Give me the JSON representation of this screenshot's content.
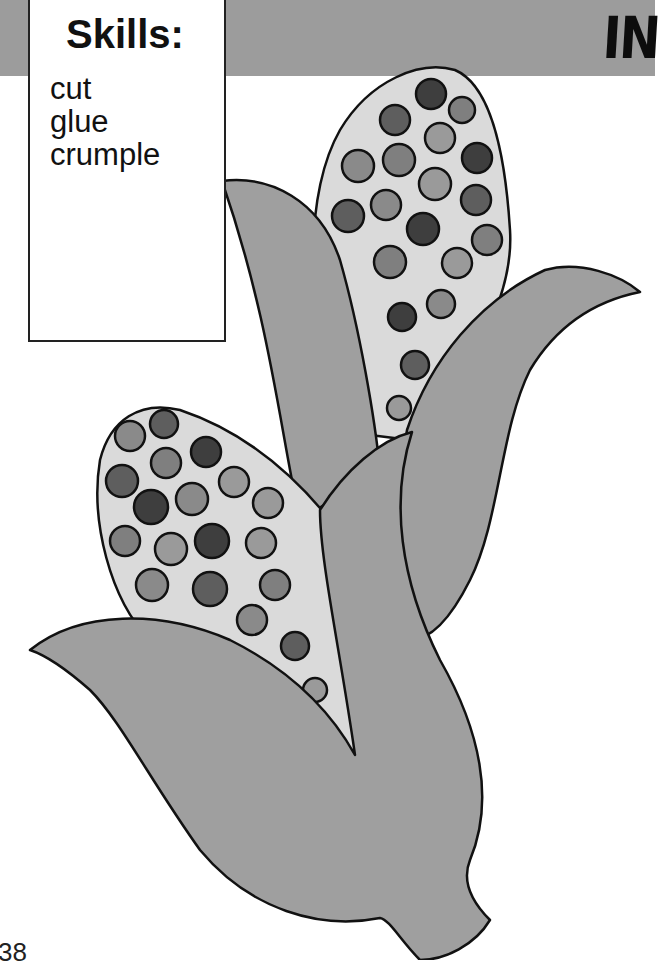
{
  "header": {
    "title": "IN",
    "band_color": "#9c9c9c"
  },
  "skills": {
    "title": "Skills:",
    "items": [
      "cut",
      "glue",
      "crumple"
    ]
  },
  "illustration": {
    "subject": "two ears of corn with husks",
    "husk_color": "#9f9f9f",
    "cob_color": "#dadada",
    "kernel_colors": [
      "#3e3e3e",
      "#5e5e5e",
      "#7f7f7f",
      "#9a9a9a"
    ],
    "outline_color": "#111111"
  },
  "footer": {
    "page_number": "38"
  }
}
